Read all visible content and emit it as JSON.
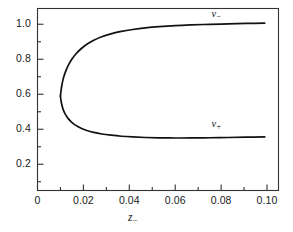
{
  "figure": {
    "background": "#ffffff",
    "line_color": "#111111",
    "axis_color": "#333333"
  },
  "axes": {
    "x": {
      "label_base": "z",
      "label_sub": "−",
      "ticks": [
        "0",
        "0.02",
        "0.04",
        "0.06",
        "0.08",
        "0.10"
      ],
      "tick_values": [
        0,
        0.02,
        0.04,
        0.06,
        0.08,
        0.1
      ],
      "minor_ticks": [
        0.01,
        0.03,
        0.05,
        0.07,
        0.09
      ],
      "range": [
        0,
        0.105
      ]
    },
    "y": {
      "ticks": [
        "0.2",
        "0.4",
        "0.6",
        "0.8",
        "1.0"
      ],
      "tick_values": [
        0.2,
        0.4,
        0.6,
        0.8,
        1.0
      ],
      "minor_ticks": [
        0.1,
        0.3,
        0.5,
        0.7,
        0.9,
        1.1
      ],
      "range": [
        0.05,
        1.09
      ]
    }
  },
  "curve_labels": [
    {
      "name": "upper-branch-label",
      "base": "v",
      "sub": "−",
      "x": 0.0775,
      "y": 1.055
    },
    {
      "name": "lower-branch-label",
      "base": "v",
      "sub": "+",
      "x": 0.0775,
      "y": 0.425
    }
  ],
  "chart_data": {
    "type": "line",
    "title": "",
    "xlabel": "z−",
    "ylabel": "",
    "xlim": [
      0,
      0.105
    ],
    "ylim": [
      0.05,
      1.09
    ],
    "grid": false,
    "legend": "inline-annotations",
    "annotations": [
      "v−",
      "v+"
    ],
    "series": [
      {
        "name": "v−",
        "comment": "upper branch of the nose curve; rises from the turning point to ~1.01",
        "x": [
          0.01,
          0.0102,
          0.0106,
          0.0112,
          0.0121,
          0.0133,
          0.0148,
          0.0167,
          0.019,
          0.0215,
          0.0245,
          0.028,
          0.032,
          0.0365,
          0.0415,
          0.047,
          0.053,
          0.06,
          0.067,
          0.075,
          0.083,
          0.091,
          0.099
        ],
        "y": [
          0.59,
          0.615,
          0.65,
          0.688,
          0.725,
          0.762,
          0.797,
          0.83,
          0.86,
          0.886,
          0.909,
          0.929,
          0.945,
          0.959,
          0.97,
          0.979,
          0.986,
          0.992,
          0.996,
          0.9995,
          1.002,
          1.0045,
          1.007
        ]
      },
      {
        "name": "v+",
        "comment": "lower branch of the nose curve; descends from the turning point to a shallow minimum then flattens near 0.355",
        "x": [
          0.01,
          0.0102,
          0.0106,
          0.0112,
          0.0121,
          0.0133,
          0.0148,
          0.0167,
          0.019,
          0.0215,
          0.0245,
          0.028,
          0.032,
          0.0365,
          0.0415,
          0.047,
          0.053,
          0.06,
          0.067,
          0.075,
          0.083,
          0.091,
          0.099
        ],
        "y": [
          0.59,
          0.568,
          0.54,
          0.512,
          0.486,
          0.462,
          0.441,
          0.422,
          0.406,
          0.393,
          0.382,
          0.373,
          0.366,
          0.36,
          0.356,
          0.353,
          0.351,
          0.35,
          0.3505,
          0.3515,
          0.353,
          0.3545,
          0.356
        ]
      }
    ],
    "turning_point": {
      "x": 0.01,
      "y": 0.59
    }
  }
}
